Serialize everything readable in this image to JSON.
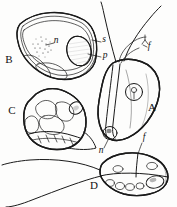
{
  "figure": {
    "background_color": "#fdfdfc",
    "ink_color": "#1a1a1a",
    "width": 177,
    "height": 207,
    "technique": "pen-and-ink stipple line drawing"
  },
  "panels": [
    {
      "id": "A",
      "label": "A",
      "label_x": 152,
      "label_y": 111,
      "description": "elongated flagellate cell with anterior flagella, central nucleus and basal dark body"
    },
    {
      "id": "B",
      "label": "B",
      "label_x": 9,
      "label_y": 63,
      "description": "rounded triangular cell in section showing stippled nucleus and dark striated body"
    },
    {
      "id": "C",
      "label": "C",
      "label_x": 12,
      "label_y": 114,
      "description": "stippled cell with internal lobed folds and basal band"
    },
    {
      "id": "D",
      "label": "D",
      "label_x": 94,
      "label_y": 189,
      "description": "oval cell with vacuoles, dark body and two long trailing flagella"
    }
  ],
  "part_labels": [
    {
      "key": "n-b",
      "text": "n",
      "x": 56,
      "y": 43,
      "leader": true,
      "panel": "B",
      "meaning": "nucleus"
    },
    {
      "key": "s-b",
      "text": "s",
      "x": 103,
      "y": 42,
      "leader": true,
      "panel": "B",
      "meaning": "stalk"
    },
    {
      "key": "p-b",
      "text": "p",
      "x": 104,
      "y": 58,
      "leader": true,
      "panel": "B",
      "meaning": "pigment body"
    },
    {
      "key": "f-a",
      "text": "f",
      "x": 148,
      "y": 48,
      "leader": true,
      "panel": "A",
      "meaning": "flagellum"
    },
    {
      "key": "n-a",
      "text": "n",
      "x": 101,
      "y": 151,
      "leader": true,
      "panel": "A",
      "meaning": "nucleus"
    },
    {
      "key": "f-d",
      "text": "f",
      "x": 144,
      "y": 140,
      "leader": true,
      "panel": "D",
      "meaning": "flagellum"
    }
  ],
  "legend": {
    "n": "nucleus",
    "s": "stalk",
    "p": "pigment body",
    "f": "flagellum"
  }
}
